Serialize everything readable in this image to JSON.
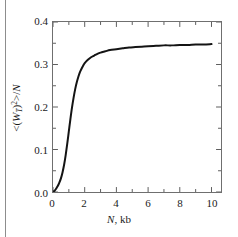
{
  "chart_data": {
    "type": "line",
    "title": "",
    "xlabel": "N, kb",
    "ylabel": "<(W_T)^2>/N",
    "xlim": [
      0,
      10.6
    ],
    "ylim": [
      0.0,
      0.4
    ],
    "grid": false,
    "legend": null,
    "x_major_ticks": [
      0,
      2,
      4,
      6,
      8,
      10
    ],
    "x_major_tick_labels": [
      "0",
      "2",
      "4",
      "6",
      "8",
      "10"
    ],
    "x_minor_ticks": [
      1,
      3,
      5,
      7,
      9
    ],
    "y_major_ticks": [
      0.0,
      0.1,
      0.2,
      0.3,
      0.4
    ],
    "y_major_tick_labels": [
      "0.0",
      "0.1",
      "0.2",
      "0.3",
      "0.4"
    ],
    "y_minor_ticks": [
      0.05,
      0.15,
      0.25,
      0.35
    ],
    "series": [
      {
        "name": "mean squared writhe per kb",
        "color": "#141414",
        "line_width": 2,
        "x": [
          0.0,
          0.1,
          0.2,
          0.3,
          0.4,
          0.5,
          0.6,
          0.7,
          0.8,
          0.9,
          1.0,
          1.1,
          1.2,
          1.3,
          1.4,
          1.5,
          1.6,
          1.7,
          1.8,
          1.9,
          2.0,
          2.2,
          2.4,
          2.6,
          2.8,
          3.0,
          3.3,
          3.6,
          4.0,
          4.4,
          4.8,
          5.2,
          5.6,
          6.0,
          6.5,
          7.0,
          7.5,
          8.0,
          8.5,
          9.0,
          9.5,
          10.0
        ],
        "y": [
          0.0,
          0.003,
          0.008,
          0.014,
          0.022,
          0.032,
          0.046,
          0.064,
          0.087,
          0.114,
          0.143,
          0.172,
          0.199,
          0.222,
          0.242,
          0.258,
          0.271,
          0.282,
          0.29,
          0.297,
          0.303,
          0.311,
          0.317,
          0.321,
          0.325,
          0.328,
          0.331,
          0.334,
          0.336,
          0.338,
          0.34,
          0.341,
          0.342,
          0.343,
          0.344,
          0.345,
          0.345,
          0.346,
          0.346,
          0.347,
          0.347,
          0.348
        ]
      }
    ],
    "asymptote": 0.348
  },
  "axis": {
    "x_tick_labels": [
      "0",
      "2",
      "4",
      "6",
      "8",
      "10"
    ],
    "y_tick_labels": [
      "0.0",
      "0.1",
      "0.2",
      "0.3",
      "0.4"
    ],
    "x_title_variable": "N",
    "x_title_units": ", kb",
    "y_title_open": "<(",
    "y_title_w": "W",
    "y_title_sub": "T",
    "y_title_close": ")",
    "y_title_sup": "2",
    "y_title_tail": ">/",
    "y_title_n": "N"
  }
}
